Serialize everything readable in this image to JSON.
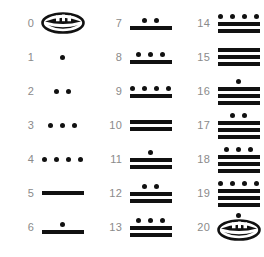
{
  "chart_data": {
    "type": "table",
    "symbols": {
      "zero": "shell",
      "one": "dot",
      "five": "bar"
    },
    "columns": [
      {
        "entries": [
          {
            "label": "0",
            "value": 0,
            "dots": 0,
            "bars": 0,
            "shell": true,
            "shell_dot": false
          },
          {
            "label": "1",
            "value": 1,
            "dots": 1,
            "bars": 0,
            "shell": false,
            "shell_dot": false
          },
          {
            "label": "2",
            "value": 2,
            "dots": 2,
            "bars": 0,
            "shell": false,
            "shell_dot": false
          },
          {
            "label": "3",
            "value": 3,
            "dots": 3,
            "bars": 0,
            "shell": false,
            "shell_dot": false
          },
          {
            "label": "4",
            "value": 4,
            "dots": 4,
            "bars": 0,
            "shell": false,
            "shell_dot": false
          },
          {
            "label": "5",
            "value": 5,
            "dots": 0,
            "bars": 1,
            "shell": false,
            "shell_dot": false
          },
          {
            "label": "6",
            "value": 6,
            "dots": 1,
            "bars": 1,
            "shell": false,
            "shell_dot": false
          }
        ]
      },
      {
        "entries": [
          {
            "label": "7",
            "value": 7,
            "dots": 2,
            "bars": 1,
            "shell": false,
            "shell_dot": false
          },
          {
            "label": "8",
            "value": 8,
            "dots": 3,
            "bars": 1,
            "shell": false,
            "shell_dot": false
          },
          {
            "label": "9",
            "value": 9,
            "dots": 4,
            "bars": 1,
            "shell": false,
            "shell_dot": false
          },
          {
            "label": "10",
            "value": 10,
            "dots": 0,
            "bars": 2,
            "shell": false,
            "shell_dot": false
          },
          {
            "label": "11",
            "value": 11,
            "dots": 1,
            "bars": 2,
            "shell": false,
            "shell_dot": false
          },
          {
            "label": "12",
            "value": 12,
            "dots": 2,
            "bars": 2,
            "shell": false,
            "shell_dot": false
          },
          {
            "label": "13",
            "value": 13,
            "dots": 3,
            "bars": 2,
            "shell": false,
            "shell_dot": false
          }
        ]
      },
      {
        "entries": [
          {
            "label": "14",
            "value": 14,
            "dots": 4,
            "bars": 2,
            "shell": false,
            "shell_dot": false
          },
          {
            "label": "15",
            "value": 15,
            "dots": 0,
            "bars": 3,
            "shell": false,
            "shell_dot": false
          },
          {
            "label": "16",
            "value": 16,
            "dots": 1,
            "bars": 3,
            "shell": false,
            "shell_dot": false
          },
          {
            "label": "17",
            "value": 17,
            "dots": 2,
            "bars": 3,
            "shell": false,
            "shell_dot": false
          },
          {
            "label": "18",
            "value": 18,
            "dots": 3,
            "bars": 3,
            "shell": false,
            "shell_dot": false
          },
          {
            "label": "19",
            "value": 19,
            "dots": 4,
            "bars": 3,
            "shell": false,
            "shell_dot": false
          },
          {
            "label": "20",
            "value": 20,
            "dots": 0,
            "bars": 0,
            "shell": true,
            "shell_dot": true
          }
        ]
      }
    ],
    "colors": {
      "glyph": "#111111",
      "label": "#8a8a8a",
      "background": "#ffffff"
    },
    "layout": {
      "rows_per_column": 7,
      "column_count": 3,
      "row_spacing_px": 34,
      "first_row_center_y_px": 23
    }
  }
}
